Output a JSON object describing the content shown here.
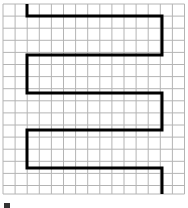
{
  "figure": {
    "grid": {
      "x0": 3,
      "y0": 4,
      "cell": 12.1,
      "cols": 15,
      "rows": 16,
      "line_color": "#b4b4b4"
    },
    "path": {
      "color": "#000000",
      "width": 3,
      "points": [
        [
          27,
          4
        ],
        [
          27,
          16
        ],
        [
          162,
          16
        ],
        [
          162,
          55
        ],
        [
          27,
          55
        ],
        [
          27,
          93
        ],
        [
          162,
          93
        ],
        [
          162,
          130
        ],
        [
          27,
          130
        ],
        [
          27,
          168
        ],
        [
          162,
          168
        ],
        [
          162,
          194
        ]
      ]
    },
    "caption_fragment": ""
  }
}
